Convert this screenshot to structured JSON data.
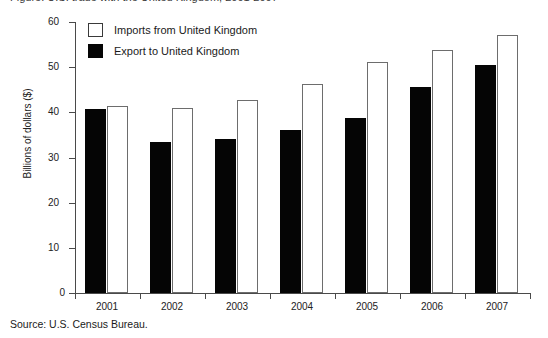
{
  "figure": {
    "cut_off_title": "Figure: U.S. trade with the United Kingdom, 2001-2007",
    "source_note": "Source: U.S. Census Bureau."
  },
  "legend": {
    "position": "top-left-inside",
    "entries": [
      {
        "label": "Imports from United Kingdom",
        "swatch": "imports",
        "color": "#ffffff"
      },
      {
        "label": "Export to United Kingdom",
        "swatch": "export",
        "color": "#050505"
      }
    ]
  },
  "axes": {
    "y_title": "Billions of dollars ($)",
    "y_ticks": [
      "0",
      "10",
      "20",
      "30",
      "40",
      "50",
      "60"
    ],
    "x_ticks": [
      "2001",
      "2002",
      "2003",
      "2004",
      "2005",
      "2006",
      "2007"
    ]
  },
  "chart_data": {
    "type": "bar",
    "title": "",
    "subtitle": "",
    "xlabel": "",
    "ylabel": "Billions of dollars ($)",
    "categories": [
      "2001",
      "2002",
      "2003",
      "2004",
      "2005",
      "2006",
      "2007"
    ],
    "series": [
      {
        "name": "Export to United Kingdom",
        "color": "#050505",
        "values": [
          40.7,
          33.4,
          34.1,
          36.1,
          38.7,
          45.6,
          50.4
        ]
      },
      {
        "name": "Imports from United Kingdom",
        "color": "#ffffff",
        "values": [
          41.3,
          40.9,
          42.8,
          46.2,
          51.2,
          53.7,
          57.1
        ]
      }
    ],
    "ylim": [
      0,
      60
    ],
    "ytick_step": 10,
    "grid": false,
    "legend_position": "upper left",
    "annotations": []
  }
}
